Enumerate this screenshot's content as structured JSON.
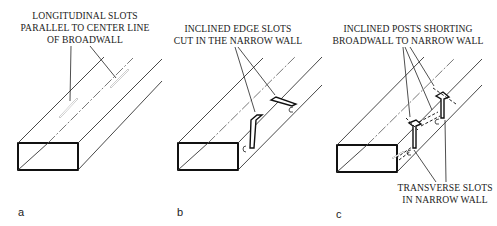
{
  "figure": {
    "panels": [
      {
        "id": "a",
        "label": "a",
        "caption_lines": [
          "LONGITUDINAL SLOTS",
          "PARALLEL TO CENTER LINE",
          "OF BROADWALL"
        ]
      },
      {
        "id": "b",
        "label": "b",
        "caption_lines": [
          "INCLINED EDGE SLOTS",
          "CUT IN THE NARROW WALL"
        ]
      },
      {
        "id": "c",
        "label": "c",
        "caption_lines": [
          "INCLINED POSTS SHORTING",
          "BROADWALL TO NARROW WALL"
        ],
        "bottom_caption_lines": [
          "TRANSVERSE SLOTS",
          "IN NARROW WALL"
        ]
      }
    ],
    "colors": {
      "background": "#ffffff",
      "ink": "#111111"
    }
  }
}
